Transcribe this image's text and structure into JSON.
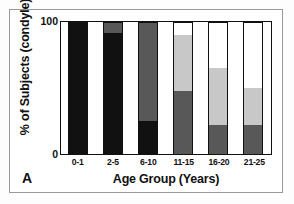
{
  "panel": {
    "letter": "A"
  },
  "chart_data": {
    "type": "bar",
    "subtype": "stacked-percent",
    "title": "",
    "xlabel": "Age Group (Years)",
    "ylabel": "% of Subjects (condyle)",
    "categories": [
      "0-1",
      "2-5",
      "6-10",
      "11-15",
      "16-20",
      "21-25"
    ],
    "ylim": [
      0,
      100
    ],
    "yticks": [
      "0",
      "100"
    ],
    "grid": false,
    "legend": "none",
    "colors": {
      "black": "#111111",
      "dark_gray": "#585858",
      "light_gray": "#c8c8c8",
      "white": "#ffffff",
      "axis": "#111111",
      "figure_border": "#9a9a9a"
    },
    "series": [
      {
        "name": "black",
        "color": "#111111",
        "values": [
          100,
          92,
          25,
          0,
          0,
          0
        ]
      },
      {
        "name": "dark gray",
        "color": "#585858",
        "values": [
          0,
          8,
          75,
          48,
          22,
          22
        ]
      },
      {
        "name": "light gray",
        "color": "#c8c8c8",
        "values": [
          0,
          0,
          0,
          42,
          43,
          28
        ]
      },
      {
        "name": "white",
        "color": "#ffffff",
        "values": [
          0,
          0,
          0,
          10,
          35,
          50
        ]
      }
    ]
  }
}
